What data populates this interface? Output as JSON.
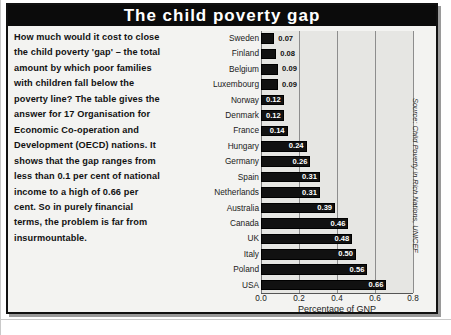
{
  "figure": {
    "title": "The child poverty gap",
    "body_text": "How much would it cost to close the child poverty 'gap' – the total amount by which poor families with children fall below the poverty line? The table gives the answer for 17 Organisation for Economic Co-operation and Development (OECD) nations. It shows that the gap ranges from less than 0.1 per cent of national income to a high of 0.66 per cent. So in purely financial terms, the problem is far from insurmountable.",
    "source": "Source: Child Poverty in Rich Nations, UNICEF",
    "colors": {
      "title_bar": "#0b0b0b",
      "title_text": "#ffffff",
      "panel_background": "#f3f3f1",
      "plot_background": "#e6e6e3",
      "bar": "#111111",
      "gridline": "#8d8d8d"
    }
  },
  "chart_data": {
    "type": "bar",
    "orientation": "horizontal",
    "title": "The child poverty gap",
    "xlabel": "Percentage of GNP",
    "ylabel": "",
    "xlim": [
      0.0,
      0.8
    ],
    "xticks": [
      "0.0",
      "0.2",
      "0.4",
      "0.6",
      "0.8"
    ],
    "xtick_values": [
      0.0,
      0.2,
      0.4,
      0.6,
      0.8
    ],
    "grid": true,
    "legend": "none",
    "categories": [
      "Sweden",
      "Finland",
      "Belgium",
      "Luxembourg",
      "Norway",
      "Denmark",
      "France",
      "Hungary",
      "Germany",
      "Spain",
      "Netherlands",
      "Australia",
      "Canada",
      "UK",
      "Italy",
      "Poland",
      "USA"
    ],
    "values": [
      0.07,
      0.08,
      0.09,
      0.09,
      0.12,
      0.12,
      0.14,
      0.24,
      0.26,
      0.31,
      0.31,
      0.39,
      0.46,
      0.48,
      0.5,
      0.56,
      0.66
    ],
    "labels": [
      "0.07",
      "0.08",
      "0.09",
      "0.09",
      "0.12",
      "0.12",
      "0.14",
      "0.24",
      "0.26",
      "0.31",
      "0.31",
      "0.39",
      "0.46",
      "0.48",
      "0.50",
      "0.56",
      "0.66"
    ],
    "label_placement": [
      "outside",
      "outside",
      "outside",
      "outside",
      "inside",
      "inside",
      "inside",
      "inside",
      "inside",
      "inside",
      "inside",
      "inside",
      "inside",
      "inside",
      "inside",
      "inside",
      "inside"
    ]
  }
}
